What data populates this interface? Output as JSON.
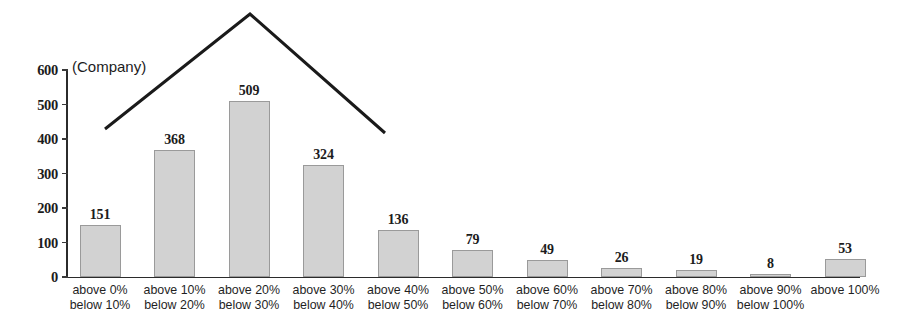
{
  "chart_data": {
    "type": "bar",
    "title": "",
    "subtitle": "",
    "unit_label": "(Company)",
    "xlabel": "",
    "ylabel": "",
    "ylim": [
      0,
      600
    ],
    "ytick_values": [
      600,
      500,
      400,
      300,
      200,
      100,
      0
    ],
    "ytick_labels": [
      "600",
      "500",
      "400",
      "300",
      "200",
      "100",
      "0"
    ],
    "grid": false,
    "legend": null,
    "bar_color": "#d2d2d2",
    "bar_border_color": "#9a9a9a",
    "axis_color": "#2b2b2b",
    "categories": [
      "above 0%\nbelow 10%",
      "above 10%\nbelow 20%",
      "above 20%\nbelow 30%",
      "above 30%\nbelow 40%",
      "above 40%\nbelow 50%",
      "above 50%\nbelow 60%",
      "above 60%\nbelow 70%",
      "above 70%\nbelow 80%",
      "above 80%\nbelow 90%",
      "above 90%\nbelow 100%",
      "above 100%"
    ],
    "category_lines": [
      [
        "above 0%",
        "below 10%"
      ],
      [
        "above 10%",
        "below 20%"
      ],
      [
        "above 20%",
        "below 30%"
      ],
      [
        "above 30%",
        "below 40%"
      ],
      [
        "above 40%",
        "below 50%"
      ],
      [
        "above 50%",
        "below 60%"
      ],
      [
        "above 60%",
        "below 70%"
      ],
      [
        "above 70%",
        "below 80%"
      ],
      [
        "above 80%",
        "below 90%"
      ],
      [
        "above 90%",
        "below 100%"
      ],
      [
        "above 100%",
        ""
      ]
    ],
    "values": [
      151,
      368,
      509,
      324,
      136,
      79,
      49,
      26,
      19,
      8,
      53
    ],
    "value_labels": [
      "151",
      "368",
      "509",
      "324",
      "136",
      "79",
      "49",
      "26",
      "19",
      "8",
      "53"
    ],
    "annotations": [
      {
        "name": "peak-tent-line",
        "type": "polyline",
        "color": "#1a1a1a",
        "points": "105,129 250,14 385,133"
      }
    ]
  }
}
